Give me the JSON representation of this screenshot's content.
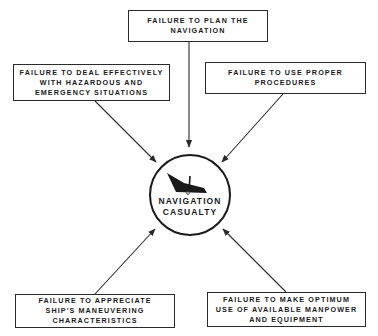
{
  "diagram": {
    "type": "cause-effect radial diagram",
    "center": {
      "label": "NAVIGATION\nCASUALTY",
      "icon": "sinking-ship-icon"
    },
    "causes": [
      {
        "id": "top",
        "label": "FAILURE TO PLAN THE\nNAVIGATION"
      },
      {
        "id": "upper-left",
        "label": "FAILURE TO DEAL EFFECTIVELY\nWITH HAZARDOUS AND\nEMERGENCY SITUATIONS"
      },
      {
        "id": "upper-right",
        "label": "FAILURE TO USE PROPER\nPROCEDURES"
      },
      {
        "id": "lower-left",
        "label": "FAILURE TO APPRECIATE\nSHIP'S MANEUVERING\nCHARACTERISTICS"
      },
      {
        "id": "lower-right",
        "label": "FAILURE TO MAKE OPTIMUM\nUSE OF AVAILABLE MANPOWER\nAND EQUIPMENT"
      }
    ],
    "colors": {
      "line": "#2a2a2a",
      "text": "#1a1a1a",
      "background": "#ffffff"
    }
  }
}
